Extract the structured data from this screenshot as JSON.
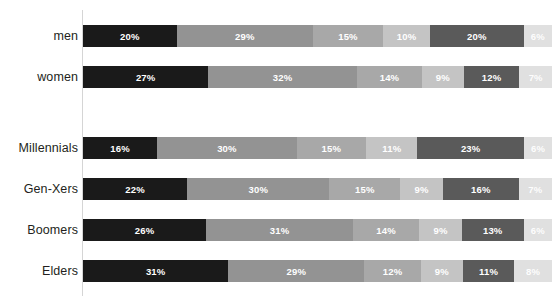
{
  "chart_data": {
    "type": "bar",
    "orientation": "horizontal",
    "stacked": true,
    "stack_mode": "percent",
    "title": "",
    "subtitle": "",
    "xlabel": "",
    "ylabel": "",
    "xlim": [
      0,
      100
    ],
    "grid": false,
    "legend": "none",
    "value_suffix": "%",
    "categories": [
      "men",
      "women",
      "Millennials",
      "Gen-Xers",
      "Boomers",
      "Elders"
    ],
    "group_breaks_after": [
      "women"
    ],
    "series": [
      {
        "name": "segment-1",
        "color": "#1a1a1a",
        "values": [
          20,
          27,
          16,
          22,
          26,
          31
        ]
      },
      {
        "name": "segment-2",
        "color": "#939393",
        "values": [
          29,
          32,
          30,
          30,
          31,
          29
        ]
      },
      {
        "name": "segment-3",
        "color": "#a8a8a8",
        "values": [
          15,
          14,
          15,
          15,
          14,
          12
        ]
      },
      {
        "name": "segment-4",
        "color": "#c4c4c4",
        "values": [
          10,
          9,
          11,
          9,
          9,
          9
        ]
      },
      {
        "name": "segment-5",
        "color": "#5a5a5a",
        "values": [
          20,
          12,
          23,
          16,
          13,
          11
        ]
      },
      {
        "name": "segment-6",
        "color": "#e0e0e0",
        "values": [
          6,
          7,
          6,
          7,
          6,
          8
        ]
      }
    ],
    "rows": [
      {
        "label": "men",
        "top": 25,
        "segments": [
          {
            "value": 20,
            "label": "20%",
            "color": "#1a1a1a"
          },
          {
            "value": 29,
            "label": "29%",
            "color": "#939393"
          },
          {
            "value": 15,
            "label": "15%",
            "color": "#a8a8a8"
          },
          {
            "value": 10,
            "label": "10%",
            "color": "#c4c4c4"
          },
          {
            "value": 20,
            "label": "20%",
            "color": "#5a5a5a"
          },
          {
            "value": 6,
            "label": "6%",
            "color": "#e0e0e0"
          }
        ]
      },
      {
        "label": "women",
        "top": 66,
        "segments": [
          {
            "value": 27,
            "label": "27%",
            "color": "#1a1a1a"
          },
          {
            "value": 32,
            "label": "32%",
            "color": "#939393"
          },
          {
            "value": 14,
            "label": "14%",
            "color": "#a8a8a8"
          },
          {
            "value": 9,
            "label": "9%",
            "color": "#c4c4c4"
          },
          {
            "value": 12,
            "label": "12%",
            "color": "#5a5a5a"
          },
          {
            "value": 7,
            "label": "7%",
            "color": "#e0e0e0"
          }
        ]
      },
      {
        "label": "Millennials",
        "top": 137,
        "segments": [
          {
            "value": 16,
            "label": "16%",
            "color": "#1a1a1a"
          },
          {
            "value": 30,
            "label": "30%",
            "color": "#939393"
          },
          {
            "value": 15,
            "label": "15%",
            "color": "#a8a8a8"
          },
          {
            "value": 11,
            "label": "11%",
            "color": "#c4c4c4"
          },
          {
            "value": 23,
            "label": "23%",
            "color": "#5a5a5a"
          },
          {
            "value": 6,
            "label": "6%",
            "color": "#e0e0e0"
          }
        ]
      },
      {
        "label": "Gen-Xers",
        "top": 178,
        "segments": [
          {
            "value": 22,
            "label": "22%",
            "color": "#1a1a1a"
          },
          {
            "value": 30,
            "label": "30%",
            "color": "#939393"
          },
          {
            "value": 15,
            "label": "15%",
            "color": "#a8a8a8"
          },
          {
            "value": 9,
            "label": "9%",
            "color": "#c4c4c4"
          },
          {
            "value": 16,
            "label": "16%",
            "color": "#5a5a5a"
          },
          {
            "value": 7,
            "label": "7%",
            "color": "#e0e0e0"
          }
        ]
      },
      {
        "label": "Boomers",
        "top": 219,
        "segments": [
          {
            "value": 26,
            "label": "26%",
            "color": "#1a1a1a"
          },
          {
            "value": 31,
            "label": "31%",
            "color": "#939393"
          },
          {
            "value": 14,
            "label": "14%",
            "color": "#a8a8a8"
          },
          {
            "value": 9,
            "label": "9%",
            "color": "#c4c4c4"
          },
          {
            "value": 13,
            "label": "13%",
            "color": "#5a5a5a"
          },
          {
            "value": 6,
            "label": "6%",
            "color": "#e0e0e0"
          }
        ]
      },
      {
        "label": "Elders",
        "top": 260,
        "segments": [
          {
            "value": 31,
            "label": "31%",
            "color": "#1a1a1a"
          },
          {
            "value": 29,
            "label": "29%",
            "color": "#939393"
          },
          {
            "value": 12,
            "label": "12%",
            "color": "#a8a8a8"
          },
          {
            "value": 9,
            "label": "9%",
            "color": "#c4c4c4"
          },
          {
            "value": 11,
            "label": "11%",
            "color": "#5a5a5a"
          },
          {
            "value": 8,
            "label": "8%",
            "color": "#e0e0e0"
          }
        ]
      }
    ],
    "palette": {
      "segment_1": "#1a1a1a",
      "segment_2": "#939393",
      "segment_3": "#a8a8a8",
      "segment_4": "#c4c4c4",
      "segment_5": "#5a5a5a",
      "segment_6": "#e0e0e0",
      "axis_line": "#d5d5d5",
      "label_text": "#231f20",
      "value_text": "#ffffff",
      "background": "#ffffff"
    }
  }
}
